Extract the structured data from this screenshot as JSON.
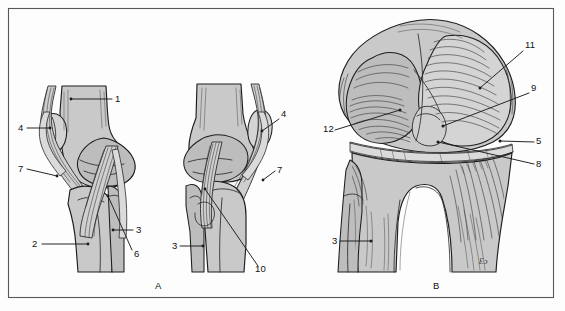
{
  "figure": {
    "background_color": "#fdfdfd",
    "frame_color": "#58585a",
    "bone_fill_color": "#c9c9c9",
    "ink_color": "#1a1a1a",
    "panels": [
      {
        "id": "A",
        "label": "A",
        "x": 155,
        "y": 289,
        "caption": "Lateral views of the flexed and extended knee"
      },
      {
        "id": "B",
        "label": "B",
        "x": 433,
        "y": 289,
        "caption": "Anterior view of the knee"
      }
    ],
    "signature": {
      "text": "Ɛɔ",
      "x": 479,
      "y": 264
    },
    "callouts": [
      {
        "id": "a1",
        "label": "1",
        "text_x": 115,
        "text_y": 102,
        "line": [
          [
            112,
            99
          ],
          [
            71,
            99
          ]
        ],
        "dot": [
          71,
          99
        ],
        "panel": "A",
        "structure": "femur-shaft"
      },
      {
        "id": "a4",
        "label": "4",
        "text_x": 18,
        "text_y": 131,
        "line": [
          [
            27,
            128
          ],
          [
            50,
            128
          ]
        ],
        "dot": [
          50,
          128
        ],
        "panel": "A",
        "structure": "patella-lateral"
      },
      {
        "id": "a7",
        "label": "7",
        "text_x": 18,
        "text_y": 172,
        "line": [
          [
            27,
            169
          ],
          [
            57,
            175
          ]
        ],
        "dot": [
          57,
          175
        ],
        "panel": "A",
        "structure": "patellar-ligament-left"
      },
      {
        "id": "a2",
        "label": "2",
        "text_x": 32,
        "text_y": 247,
        "line": [
          [
            42,
            244
          ],
          [
            88,
            244
          ]
        ],
        "dot": [
          88,
          244
        ],
        "panel": "A",
        "structure": "tibia-shaft"
      },
      {
        "id": "a3",
        "label": "3",
        "text_x": 136,
        "text_y": 233,
        "line": [
          [
            133,
            230
          ],
          [
            113,
            230
          ]
        ],
        "dot": [
          113,
          230
        ],
        "panel": "A",
        "structure": "fibula-head-left"
      },
      {
        "id": "a6",
        "label": "6",
        "text_x": 134,
        "text_y": 257,
        "line": [
          [
            133,
            252
          ],
          [
            108,
            196
          ]
        ],
        "dot": [
          108,
          196
        ],
        "panel": "A",
        "structure": "collateral-ligament-left"
      },
      {
        "id": "b4",
        "label": "4",
        "text_x": 281,
        "text_y": 117,
        "line": [
          [
            279,
            119
          ],
          [
            262,
            131
          ]
        ],
        "dot": [
          262,
          131
        ],
        "panel": "A",
        "structure": "patella-lateral-mid"
      },
      {
        "id": "b7",
        "label": "7",
        "text_x": 277,
        "text_y": 173,
        "line": [
          [
            275,
            171
          ],
          [
            263,
            180
          ]
        ],
        "dot": [
          263,
          180
        ],
        "panel": "A",
        "structure": "patellar-ligament-mid"
      },
      {
        "id": "b3",
        "label": "3",
        "text_x": 172,
        "text_y": 249,
        "line": [
          [
            180,
            246
          ],
          [
            203,
            246
          ]
        ],
        "dot": [
          203,
          246
        ],
        "panel": "A",
        "structure": "fibula-head-mid"
      },
      {
        "id": "b10",
        "label": "10",
        "text_x": 255,
        "text_y": 272,
        "line": [
          [
            258,
            266
          ],
          [
            205,
            189
          ]
        ],
        "dot": [
          205,
          189
        ],
        "panel": "A",
        "structure": "cruciate-ligament"
      },
      {
        "id": "c11",
        "label": "11",
        "text_x": 525,
        "text_y": 48,
        "line": [
          [
            523,
            51
          ],
          [
            480,
            88
          ]
        ],
        "dot": [
          480,
          88
        ],
        "panel": "B",
        "structure": "lateral-femoral-condyle"
      },
      {
        "id": "c9",
        "label": "9",
        "text_x": 531,
        "text_y": 91,
        "line": [
          [
            529,
            93
          ],
          [
            443,
            126
          ]
        ],
        "dot": [
          443,
          126
        ],
        "panel": "B",
        "structure": "intercondylar-notch"
      },
      {
        "id": "c5",
        "label": "5",
        "text_x": 536,
        "text_y": 144,
        "line": [
          [
            534,
            142
          ],
          [
            500,
            141
          ]
        ],
        "dot": [
          500,
          141
        ],
        "panel": "B",
        "structure": "joint-line"
      },
      {
        "id": "c8",
        "label": "8",
        "text_x": 536,
        "text_y": 167,
        "line": [
          [
            534,
            164
          ],
          [
            438,
            142
          ]
        ],
        "dot": [
          438,
          142
        ],
        "panel": "B",
        "structure": "meniscus"
      },
      {
        "id": "c12",
        "label": "12",
        "text_x": 323,
        "text_y": 132,
        "line": [
          [
            335,
            130
          ],
          [
            400,
            110
          ]
        ],
        "dot": [
          400,
          110
        ],
        "panel": "B",
        "structure": "medial-femoral-condyle"
      },
      {
        "id": "c3",
        "label": "3",
        "text_x": 332,
        "text_y": 244,
        "line": [
          [
            340,
            241
          ],
          [
            371,
            241
          ]
        ],
        "dot": [
          371,
          241
        ],
        "panel": "B",
        "structure": "fibula-head-anterior"
      }
    ]
  }
}
